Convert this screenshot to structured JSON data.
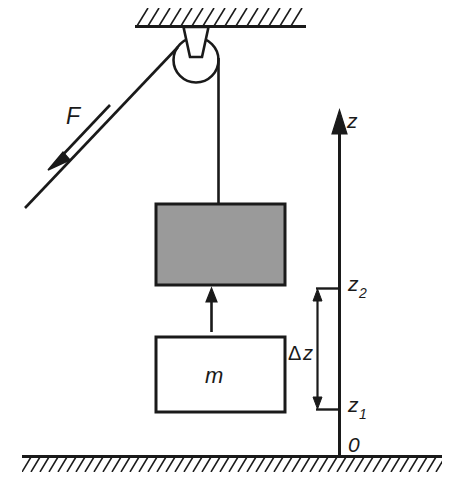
{
  "figure": {
    "domain_kind": "physics-diagram",
    "labels": {
      "force": "F",
      "axis": "z",
      "mass": "m",
      "delta": "Δ",
      "delta_var": "z",
      "z_upper_base": "z",
      "z_upper_sub": "2",
      "z_lower_base": "z",
      "z_lower_sub": "1",
      "origin": "0"
    },
    "colors": {
      "stroke": "#1a1a1a",
      "block_raised_fill": "#9a9a9a",
      "block_lowered_fill": "#ffffff",
      "background": "#ffffff"
    },
    "elements": {
      "ceiling": "hatched-ceiling",
      "pulley": "pulley-wheel",
      "bracket": "pulley-bracket",
      "rope_angled": "rope-pull-side",
      "rope_vertical": "rope-load-side",
      "force_arrow": "force-arrow",
      "block_raised": "block-raised",
      "block_lowered": "block-lowered",
      "motion_arrow": "motion-arrow-up",
      "axis": "z-axis",
      "tick_upper": "tick-z2",
      "tick_lower": "tick-z1",
      "dimension": "delta-z-dimension",
      "ground": "hatched-ground"
    }
  }
}
